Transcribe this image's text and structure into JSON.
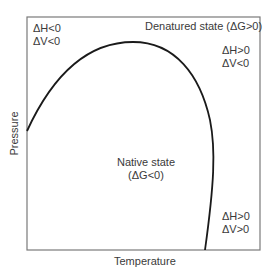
{
  "diagram": {
    "xlabel": "Temperature",
    "ylabel": "Pressure",
    "regions": {
      "native": {
        "line1": "Native state",
        "line2": "(ΔG<0)"
      },
      "denatured": "Denatured state (ΔG>0)"
    },
    "annotations": {
      "top_left": {
        "line1": "ΔH<0",
        "line2": "ΔV<0"
      },
      "top_right": {
        "line1": "ΔH>0",
        "line2": "ΔV<0"
      },
      "bottom_right": {
        "line1": "ΔH>0",
        "line2": "ΔV>0"
      }
    },
    "colors": {
      "curve": "#1a1a1a",
      "frame": "#777777",
      "text": "#3a3a3a"
    }
  }
}
